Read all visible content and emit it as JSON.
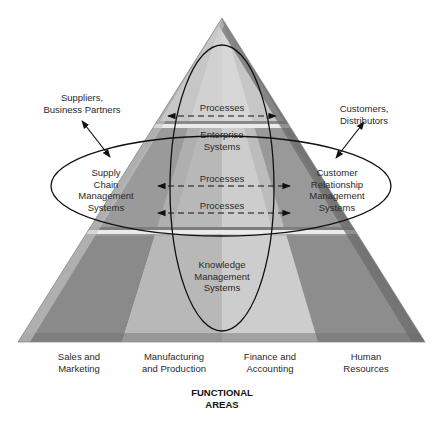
{
  "diagram": {
    "type": "enterprise-application-architecture-pyramid",
    "colors": {
      "col_sales": "#8a8a8a",
      "col_manufacturing": "#b9b9b9",
      "col_finance": "#cfcfcf",
      "col_hr": "#8f8f8f",
      "apex_light": "#dcdcdc",
      "band_dark": "#7e7e7e",
      "band_light": "#ececec",
      "edge_dark": "#6e6e6e",
      "outline": "#111111"
    },
    "external": {
      "suppliers": [
        "Suppliers,",
        "Business Partners"
      ],
      "customers": [
        "Customers,",
        "Distributors"
      ]
    },
    "systems": {
      "enterprise": [
        "Enterprise",
        "Systems"
      ],
      "scm": [
        "Supply",
        "Chain",
        "Management",
        "Systems"
      ],
      "crm": [
        "Customer",
        "Relationship",
        "Management",
        "Systems"
      ],
      "kms": [
        "Knowledge",
        "Management",
        "Systems"
      ]
    },
    "processes": [
      {
        "label": "Processes",
        "y": 114
      },
      {
        "label": "Processes",
        "y": 185
      },
      {
        "label": "Processes",
        "y": 211
      }
    ],
    "functional_areas": {
      "title": [
        "FUNCTIONAL",
        "AREAS"
      ],
      "items": [
        {
          "lines": [
            "Sales and",
            "Marketing"
          ]
        },
        {
          "lines": [
            "Manufacturing",
            "and Production"
          ]
        },
        {
          "lines": [
            "Finance and",
            "Accounting"
          ]
        },
        {
          "lines": [
            "Human",
            "Resources"
          ]
        }
      ]
    }
  }
}
